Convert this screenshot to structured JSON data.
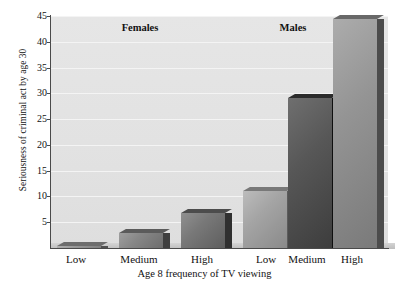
{
  "chart_data": {
    "type": "bar",
    "title": "",
    "xlabel": "Age 8 frequency of TV viewing",
    "ylabel": "Seriousness of criminal act by age 30",
    "ylim": [
      0,
      45
    ],
    "yticks": [
      5,
      10,
      15,
      20,
      25,
      30,
      35,
      40,
      45
    ],
    "grid": true,
    "legend": "none",
    "group_labels": [
      "Females",
      "Males"
    ],
    "categories": [
      "Low",
      "Medium",
      "High",
      "Low",
      "Medium",
      "High"
    ],
    "values": [
      0.2,
      3.0,
      6.8,
      11.0,
      29.0,
      44.5
    ],
    "bars": [
      {
        "group": "Females",
        "category": "Low",
        "value": 0.2,
        "color": "#8f8f8f"
      },
      {
        "group": "Females",
        "category": "Medium",
        "value": 3.0,
        "color": "#7d7d7d"
      },
      {
        "group": "Females",
        "category": "High",
        "value": 6.8,
        "color": "#6e6e6e"
      },
      {
        "group": "Males",
        "category": "Low",
        "value": 11.0,
        "color": "#9a9a9a"
      },
      {
        "group": "Males",
        "category": "Medium",
        "value": 29.0,
        "color": "#4d4d4d"
      },
      {
        "group": "Males",
        "category": "High",
        "value": 44.5,
        "color": "#8a8a8a"
      }
    ],
    "plot_background": "#e3e3e3",
    "gridline_color": "#f4f4f4",
    "axis_color": "#4a4a4a"
  }
}
